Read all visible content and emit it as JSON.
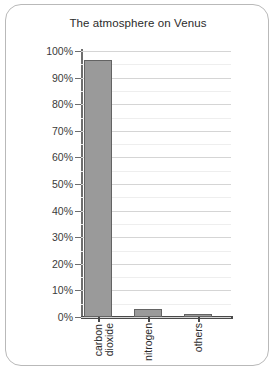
{
  "chart_data": {
    "type": "bar",
    "title": "The atmosphere on Venus",
    "xlabel": "",
    "ylabel": "",
    "categories": [
      "carbon dioxide",
      "nitrogen",
      "others"
    ],
    "category_lines": [
      [
        "carbon",
        "dioxide"
      ],
      [
        "nitrogen"
      ],
      [
        "others"
      ]
    ],
    "values": [
      96.5,
      3.0,
      1.0
    ],
    "value_unit": "%",
    "ylim": [
      0,
      100
    ],
    "ytick_labels": [
      "0%",
      "10%",
      "20%",
      "30%",
      "40%",
      "50%",
      "60%",
      "70%",
      "80%",
      "90%",
      "100%"
    ],
    "ytick_values": [
      0,
      10,
      20,
      30,
      40,
      50,
      60,
      70,
      80,
      90,
      100
    ],
    "grid": true,
    "minor_grid_step": 5,
    "legend": false,
    "bar_color": "#9a9a9a",
    "bar_border_color": "#636363",
    "gridline_color": "#d5d5d5",
    "axis_color": "#4a4a4a",
    "frame_color": "#b9b9b9"
  }
}
